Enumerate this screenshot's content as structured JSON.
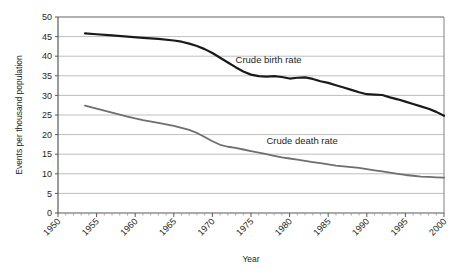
{
  "chart_data": {
    "type": "line",
    "title": "",
    "xlabel": "Year",
    "ylabel": "Events per thousand population",
    "xlim": [
      1950,
      2000
    ],
    "ylim": [
      0,
      50
    ],
    "ytick_step": 5,
    "xtick_step": 5,
    "grid": "horizontal",
    "legend_position": "inline-annotations",
    "x_tick_labels": [
      "1950",
      "1955",
      "1960",
      "1965",
      "1970",
      "1975",
      "1980",
      "1985",
      "1990",
      "1995",
      "2000"
    ],
    "y_tick_labels": [
      "0",
      "5",
      "10",
      "15",
      "20",
      "25",
      "30",
      "35",
      "40",
      "45",
      "50"
    ],
    "series": [
      {
        "name": "Crude birth rate",
        "color": "#1a1a1a",
        "width": 2.2,
        "label_x": 1973.0,
        "label_y": 38.2,
        "x": [
          1953.5,
          1955,
          1957,
          1959,
          1961,
          1963,
          1965,
          1966,
          1967,
          1968,
          1969,
          1970,
          1971,
          1972,
          1973,
          1974,
          1975,
          1976,
          1977,
          1978,
          1979,
          1980,
          1981,
          1982,
          1983,
          1984,
          1985,
          1986,
          1987,
          1988,
          1989,
          1990,
          1991,
          1992,
          1993,
          1994,
          1995,
          1996,
          1997,
          1998,
          1999,
          2000
        ],
        "values": [
          45.8,
          45.6,
          45.3,
          45.0,
          44.7,
          44.4,
          44.0,
          43.7,
          43.2,
          42.6,
          41.8,
          40.8,
          39.6,
          38.4,
          37.2,
          36.1,
          35.3,
          34.9,
          34.8,
          34.9,
          34.7,
          34.3,
          34.5,
          34.6,
          34.2,
          33.6,
          33.2,
          32.6,
          32.0,
          31.4,
          30.8,
          30.3,
          30.2,
          30.1,
          29.5,
          29.0,
          28.4,
          27.8,
          27.2,
          26.6,
          25.8,
          24.8
        ]
      },
      {
        "name": "Crude death rate",
        "color": "#6d6e71",
        "width": 1.8,
        "label_x": 1977.0,
        "label_y": 17.6,
        "x": [
          1953.5,
          1955,
          1957,
          1959,
          1961,
          1963,
          1965,
          1966,
          1967,
          1968,
          1969,
          1970,
          1971,
          1972,
          1973,
          1974,
          1975,
          1976,
          1977,
          1978,
          1979,
          1980,
          1981,
          1982,
          1983,
          1984,
          1985,
          1986,
          1987,
          1988,
          1989,
          1990,
          1991,
          1992,
          1993,
          1994,
          1995,
          1996,
          1997,
          1998,
          1999,
          2000
        ],
        "values": [
          27.4,
          26.6,
          25.6,
          24.6,
          23.7,
          23.0,
          22.2,
          21.7,
          21.2,
          20.4,
          19.4,
          18.3,
          17.4,
          16.9,
          16.6,
          16.2,
          15.8,
          15.4,
          15.0,
          14.6,
          14.2,
          13.9,
          13.6,
          13.3,
          13.0,
          12.7,
          12.4,
          12.1,
          11.9,
          11.7,
          11.5,
          11.2,
          10.9,
          10.6,
          10.3,
          10.0,
          9.7,
          9.5,
          9.3,
          9.2,
          9.1,
          9.0
        ]
      }
    ]
  }
}
